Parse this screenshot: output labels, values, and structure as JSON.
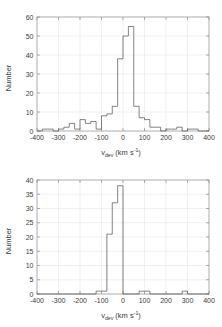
{
  "figure": {
    "background": "#ffffff",
    "line_color": "#5a5a5a",
    "axis_color": "#8a8a8a",
    "grid_color": "#e2e2e2"
  },
  "panels": [
    {
      "name": "top-histogram",
      "ylabel": "Number",
      "xlabel_main": "v",
      "xlabel_sub": "dev",
      "xlabel_unit": " (km s",
      "xlabel_sup": "-1",
      "xlabel_close": ")",
      "xticks": [
        "-400",
        "-300",
        "-200",
        "-100",
        "0",
        "100",
        "200",
        "300",
        "400"
      ],
      "yticks": [
        "0",
        "10",
        "20",
        "30",
        "40",
        "50",
        "60"
      ]
    },
    {
      "name": "bottom-histogram",
      "ylabel": "Number",
      "xlabel_main": "v",
      "xlabel_sub": "dev",
      "xlabel_unit": " (km s",
      "xlabel_sup": "-1",
      "xlabel_close": ")",
      "xticks": [
        "-400",
        "-300",
        "-200",
        "-100",
        "0",
        "100",
        "200",
        "300",
        "400"
      ],
      "yticks": [
        "0",
        "5",
        "10",
        "15",
        "20",
        "25",
        "30",
        "35",
        "40"
      ]
    }
  ],
  "chart_data": [
    {
      "type": "bar",
      "title": "",
      "subtitle": "",
      "panel": "top",
      "xlabel": "v_dev (km s^-1)",
      "ylabel": "Number",
      "xlim": [
        -400,
        400
      ],
      "ylim": [
        0,
        60
      ],
      "xtick_values": [
        -400,
        -300,
        -200,
        -100,
        0,
        100,
        200,
        300,
        400
      ],
      "ytick_values": [
        0,
        10,
        20,
        30,
        40,
        50,
        60
      ],
      "bin_width": 25,
      "grid": true,
      "legend": "none",
      "bin_edges": [
        -400,
        -375,
        -350,
        -325,
        -300,
        -275,
        -250,
        -225,
        -200,
        -175,
        -150,
        -125,
        -100,
        -75,
        -50,
        -25,
        0,
        25,
        50,
        75,
        100,
        125,
        150,
        175,
        200,
        225,
        250,
        275,
        300,
        325,
        350,
        375,
        400
      ],
      "values": [
        0,
        1,
        1,
        0,
        1,
        2,
        4,
        1,
        6,
        4,
        5,
        1,
        8,
        9,
        13,
        38,
        50,
        55,
        13,
        7,
        6,
        2,
        2,
        0,
        1,
        1,
        2,
        0,
        1,
        1,
        0,
        0
      ]
    },
    {
      "type": "bar",
      "title": "",
      "subtitle": "",
      "panel": "bottom",
      "xlabel": "v_dev (km s^-1)",
      "ylabel": "Number",
      "xlim": [
        -400,
        400
      ],
      "ylim": [
        0,
        40
      ],
      "xtick_values": [
        -400,
        -300,
        -200,
        -100,
        0,
        100,
        200,
        300,
        400
      ],
      "ytick_values": [
        0,
        5,
        10,
        15,
        20,
        25,
        30,
        35,
        40
      ],
      "bin_width": 25,
      "grid": true,
      "legend": "none",
      "bin_edges": [
        -400,
        -375,
        -350,
        -325,
        -300,
        -275,
        -250,
        -225,
        -200,
        -175,
        -150,
        -125,
        -100,
        -75,
        -50,
        -25,
        0,
        25,
        50,
        75,
        100,
        125,
        150,
        175,
        200,
        225,
        250,
        275,
        300,
        325,
        350,
        375,
        400
      ],
      "values": [
        0,
        0,
        0,
        0,
        0,
        0,
        0,
        0,
        0,
        0,
        0,
        1,
        1,
        21,
        32,
        38,
        0,
        0,
        0,
        1,
        1,
        0,
        0,
        0,
        0,
        0,
        0,
        1,
        0,
        0,
        0,
        0
      ]
    }
  ]
}
